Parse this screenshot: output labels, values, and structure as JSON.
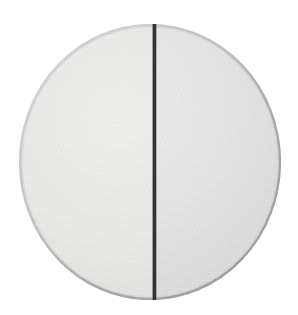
{
  "canvas": {
    "width": 298,
    "height": 315,
    "background_color": "#ffffff"
  },
  "scene": {
    "subject": "bisected-disc",
    "description": "A pale gray circular disc divided into two halves by a single dark vertical line through its center."
  },
  "disc": {
    "center_x": 150,
    "center_y": 162,
    "diameter": 262,
    "left_edge_x": 19,
    "right_edge_x": 281,
    "top_edge_y": 24,
    "bottom_edge_y": 300,
    "rim_color": "#b5b5b5",
    "rim_shadow_color": "#a8a8a8",
    "left_half": {
      "label": "left-half",
      "fill_color": "#ececea",
      "highlight_color": "#f3f3f1"
    },
    "right_half": {
      "label": "right-half",
      "fill_color": "#e7e7e7",
      "highlight_color": "#efefef"
    }
  },
  "divider": {
    "label": "divider-line",
    "color": "#333333",
    "width_px": 3,
    "x": 153,
    "top_y": 24,
    "bottom_y": 300,
    "orientation": "vertical"
  }
}
